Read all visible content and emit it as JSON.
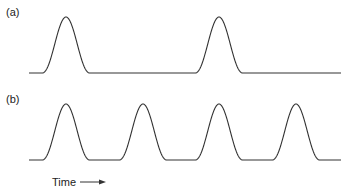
{
  "panels": [
    {
      "label": "(a)",
      "baseline_y": 73,
      "peak_y": 17,
      "x_start": 29,
      "x_end": 341,
      "peaks_x": [
        66,
        219
      ]
    },
    {
      "label": "(b)",
      "baseline_y": 160,
      "peak_y": 104,
      "x_start": 29,
      "x_end": 341,
      "peaks_x": [
        66,
        143,
        219,
        296
      ]
    }
  ],
  "axis_label": "Time",
  "axis_arrow": "arrow-right",
  "colors": {
    "line": "#333333",
    "background": "#ffffff"
  }
}
